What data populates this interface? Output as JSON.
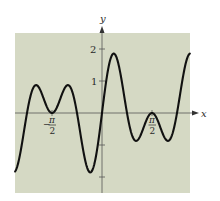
{
  "chart_data": {
    "type": "line",
    "title": "",
    "xlabel": "x",
    "ylabel": "y",
    "function": "2 cos(x) sin(4x)",
    "xlim": [
      -2.73,
      2.76
    ],
    "ylim": [
      -2.5,
      2.5
    ],
    "grid": false,
    "legend": null,
    "background_color": "#d5d9c4",
    "line_color": "#111111",
    "x_ticks": [
      {
        "value": -1.5708,
        "label_sign": "−",
        "label_num": "π",
        "label_den": "2"
      },
      {
        "value": 1.5708,
        "label_sign": "",
        "label_num": "π",
        "label_den": "2"
      }
    ],
    "y_ticks": [
      {
        "value": 2,
        "label": "2"
      },
      {
        "value": 1,
        "label": "1"
      },
      {
        "value": -1,
        "label": ""
      },
      {
        "value": -2,
        "label": ""
      }
    ],
    "key_points": [
      {
        "x": -2.73,
        "y": -1.83
      },
      {
        "x": -2.356,
        "y": 0
      },
      {
        "x": -2.1,
        "y": 0.86
      },
      {
        "x": -1.5708,
        "y": 0
      },
      {
        "x": -1.04,
        "y": 0.86
      },
      {
        "x": -0.785,
        "y": 0
      },
      {
        "x": -0.39,
        "y": -1.85
      },
      {
        "x": 0,
        "y": 0
      },
      {
        "x": 0.39,
        "y": 1.85
      },
      {
        "x": 0.785,
        "y": 0
      },
      {
        "x": 1.04,
        "y": -0.86
      },
      {
        "x": 1.5708,
        "y": 0
      },
      {
        "x": 2.1,
        "y": -0.86
      },
      {
        "x": 2.356,
        "y": 0
      },
      {
        "x": 2.76,
        "y": 1.84
      }
    ]
  },
  "labels": {
    "x_axis": "x",
    "y_axis": "y",
    "y_tick_2": "2",
    "y_tick_1": "1",
    "neg_pi_over_2_sign": "−",
    "pi": "π",
    "two": "2"
  }
}
